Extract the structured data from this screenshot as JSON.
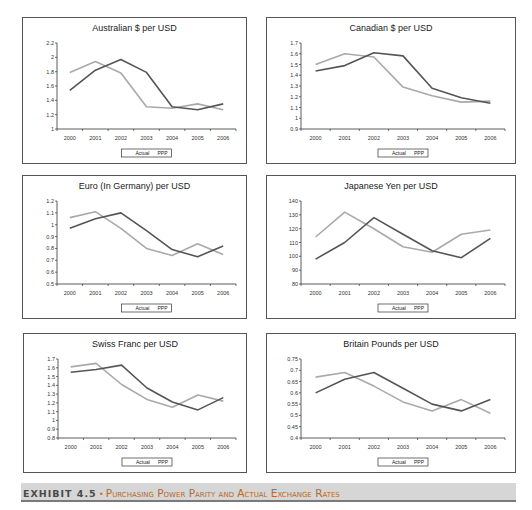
{
  "caption": {
    "label": "EXHIBIT 4.5",
    "bullet": "•",
    "text": "Purchasing Power Parity and Actual Exchange Rates"
  },
  "colors": {
    "actual": "#555555",
    "ppp": "#a9a9a9",
    "caption_bg": "#d6d6d6",
    "caption_accent": "#b56a2c"
  },
  "legend": {
    "actual": "Actual",
    "ppp": "PPP"
  },
  "chart_data": [
    {
      "type": "line",
      "title": "Australian $ per USD",
      "categories": [
        "2000",
        "2001",
        "2002",
        "2003",
        "2004",
        "2005",
        "2006"
      ],
      "yticks": [
        "1",
        "1.2",
        "1.4",
        "1.6",
        "1.8",
        "2",
        "2.2"
      ],
      "ylim": [
        1,
        2.2
      ],
      "series": [
        {
          "name": "Actual",
          "values": [
            1.54,
            1.82,
            1.97,
            1.79,
            1.31,
            1.27,
            1.35
          ]
        },
        {
          "name": "PPP",
          "values": [
            1.79,
            1.94,
            1.78,
            1.31,
            1.29,
            1.35,
            1.27
          ]
        }
      ],
      "xlabel": "",
      "ylabel": "",
      "grid": false,
      "legend_position": "bottom"
    },
    {
      "type": "line",
      "title": "Canadian $ per USD",
      "categories": [
        "2000",
        "2001",
        "2002",
        "2003",
        "2004",
        "2005",
        "2006"
      ],
      "yticks": [
        "0.9",
        "1",
        "1.1",
        "1.2",
        "1.3",
        "1.4",
        "1.5",
        "1.6",
        "1.7"
      ],
      "ylim": [
        0.9,
        1.7
      ],
      "series": [
        {
          "name": "Actual",
          "values": [
            1.44,
            1.49,
            1.61,
            1.58,
            1.28,
            1.19,
            1.14
          ]
        },
        {
          "name": "PPP",
          "values": [
            1.5,
            1.6,
            1.57,
            1.29,
            1.21,
            1.15,
            1.16
          ]
        }
      ],
      "xlabel": "",
      "ylabel": "",
      "grid": false,
      "legend_position": "bottom"
    },
    {
      "type": "line",
      "title": "Euro (In Germany) per USD",
      "categories": [
        "2000",
        "2001",
        "2002",
        "2003",
        "2004",
        "2005",
        "2006"
      ],
      "yticks": [
        "0.5",
        "0.6",
        "0.7",
        "0.8",
        "0.9",
        "1",
        "1.1",
        "1.2"
      ],
      "ylim": [
        0.5,
        1.2
      ],
      "series": [
        {
          "name": "Actual",
          "values": [
            0.97,
            1.05,
            1.1,
            0.95,
            0.79,
            0.73,
            0.82
          ]
        },
        {
          "name": "PPP",
          "values": [
            1.06,
            1.11,
            0.97,
            0.8,
            0.74,
            0.84,
            0.75
          ]
        }
      ],
      "xlabel": "",
      "ylabel": "",
      "grid": false,
      "legend_position": "bottom"
    },
    {
      "type": "line",
      "title": "Japanese Yen per USD",
      "categories": [
        "2000",
        "2001",
        "2002",
        "2003",
        "2004",
        "2005",
        "2006"
      ],
      "yticks": [
        "80",
        "90",
        "100",
        "110",
        "120",
        "130",
        "140"
      ],
      "ylim": [
        80,
        140
      ],
      "series": [
        {
          "name": "Actual",
          "values": [
            98,
            110,
            128,
            116,
            104,
            99,
            113
          ]
        },
        {
          "name": "PPP",
          "values": [
            114,
            132,
            120,
            107,
            103,
            116,
            119
          ]
        }
      ],
      "xlabel": "",
      "ylabel": "",
      "grid": false,
      "legend_position": "bottom"
    },
    {
      "type": "line",
      "title": "Swiss Franc per USD",
      "categories": [
        "2000",
        "2001",
        "2002",
        "2003",
        "2004",
        "2005",
        "2006"
      ],
      "yticks": [
        "0.8",
        "0.9",
        "1",
        "1.1",
        "1.2",
        "1.3",
        "1.4",
        "1.5",
        "1.6",
        "1.7"
      ],
      "ylim": [
        0.8,
        1.7
      ],
      "series": [
        {
          "name": "Actual",
          "values": [
            1.55,
            1.58,
            1.63,
            1.37,
            1.21,
            1.12,
            1.26
          ]
        },
        {
          "name": "PPP",
          "values": [
            1.61,
            1.65,
            1.41,
            1.24,
            1.15,
            1.29,
            1.22
          ]
        }
      ],
      "xlabel": "",
      "ylabel": "",
      "grid": false,
      "legend_position": "bottom"
    },
    {
      "type": "line",
      "title": "Britain Pounds per USD",
      "categories": [
        "2000",
        "2001",
        "2002",
        "2003",
        "2004",
        "2005",
        "2006"
      ],
      "yticks": [
        "0.4",
        "0.45",
        "0.5",
        "0.55",
        "0.6",
        "0.65",
        "0.7",
        "0.75"
      ],
      "ylim": [
        0.4,
        0.75
      ],
      "series": [
        {
          "name": "Actual",
          "values": [
            0.6,
            0.66,
            0.69,
            0.62,
            0.55,
            0.52,
            0.57
          ]
        },
        {
          "name": "PPP",
          "values": [
            0.67,
            0.69,
            0.63,
            0.56,
            0.52,
            0.57,
            0.51
          ]
        }
      ],
      "xlabel": "",
      "ylabel": "",
      "grid": false,
      "legend_position": "bottom"
    }
  ]
}
